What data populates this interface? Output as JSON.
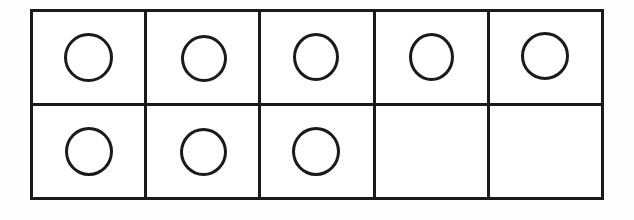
{
  "figure": {
    "name": "ten-frame",
    "title": "Ten Frame",
    "description": "A two-by-five ten frame with eight circle counters drawn in. The top row is completely filled with five circles; the bottom row holds three circles on the left and two empty cells on the right.",
    "rows": 2,
    "columns": 5,
    "total_cells": 10,
    "filled_count": 8,
    "empty_count": 2,
    "counter_shape": "circle",
    "counter_fill": "none",
    "colors": {
      "line": "#1a1a1a",
      "cell_background": "#ffffff",
      "page_background": "#fefefe",
      "counter_stroke": "#1a1a1a"
    },
    "line_width_px": 3,
    "counter_diameter_px": 47
  },
  "grid": {
    "rows": [
      {
        "row_label": "row-1",
        "cells": [
          {
            "id": "r1c1",
            "filled": true,
            "counter": "circle-counter"
          },
          {
            "id": "r1c2",
            "filled": true,
            "counter": "circle-counter"
          },
          {
            "id": "r1c3",
            "filled": true,
            "counter": "circle-counter"
          },
          {
            "id": "r1c4",
            "filled": true,
            "counter": "circle-counter"
          },
          {
            "id": "r1c5",
            "filled": true,
            "counter": "circle-counter"
          }
        ]
      },
      {
        "row_label": "row-2",
        "cells": [
          {
            "id": "r2c1",
            "filled": true,
            "counter": "circle-counter"
          },
          {
            "id": "r2c2",
            "filled": true,
            "counter": "circle-counter"
          },
          {
            "id": "r2c3",
            "filled": true,
            "counter": "circle-counter"
          },
          {
            "id": "r2c4",
            "filled": false,
            "counter": null
          },
          {
            "id": "r2c5",
            "filled": false,
            "counter": null
          }
        ]
      }
    ]
  }
}
